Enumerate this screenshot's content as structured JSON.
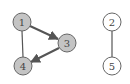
{
  "graph": {
    "colors": {
      "edge": "#555555",
      "node_stroke": "#666666",
      "filled_node": "#c4c4c4",
      "empty_node": "#ffffff",
      "label": "#444444"
    },
    "nodes": [
      {
        "id": "1",
        "label": "1",
        "x": 22,
        "y": 22,
        "filled": true
      },
      {
        "id": "3",
        "label": "3",
        "x": 67,
        "y": 43,
        "filled": true
      },
      {
        "id": "4",
        "label": "4",
        "x": 23,
        "y": 66,
        "filled": true
      },
      {
        "id": "2",
        "label": "2",
        "x": 112,
        "y": 22,
        "filled": false
      },
      {
        "id": "5",
        "label": "5",
        "x": 112,
        "y": 66,
        "filled": false
      }
    ],
    "edges": [
      {
        "from": "1",
        "to": "3",
        "directed": true
      },
      {
        "from": "3",
        "to": "4",
        "directed": true
      },
      {
        "from": "1",
        "to": "4",
        "directed": false
      },
      {
        "from": "2",
        "to": "5",
        "directed": false
      }
    ]
  }
}
